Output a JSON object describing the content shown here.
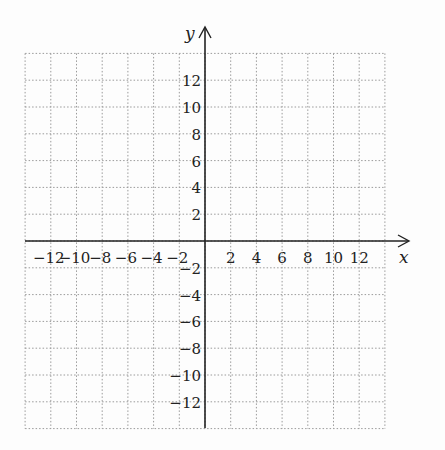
{
  "chart_data": {
    "type": "scatter",
    "title": "",
    "xlabel": "x",
    "ylabel": "y",
    "xlim": [
      -14,
      14
    ],
    "ylim": [
      -14,
      14
    ],
    "grid": true,
    "x_ticks": [
      -12,
      -10,
      -8,
      -6,
      -4,
      -2,
      2,
      4,
      6,
      8,
      10,
      12
    ],
    "y_ticks": [
      12,
      10,
      8,
      6,
      4,
      2,
      -2,
      -4,
      -6,
      -8,
      -10,
      -12
    ],
    "x_tick_labels": [
      "−12",
      "−10",
      "−8",
      "−6",
      "−4",
      "−2",
      "2",
      "4",
      "6",
      "8",
      "10",
      "12"
    ],
    "y_tick_labels": [
      "12",
      "10",
      "8",
      "6",
      "4",
      "2",
      "−2",
      "−4",
      "−6",
      "−8",
      "−10",
      "−12"
    ],
    "series": []
  },
  "colors": {
    "grid": "#9a9a9a",
    "axis": "#222222",
    "background": "#fdfdfd"
  }
}
